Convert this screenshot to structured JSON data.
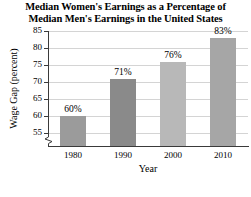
{
  "chart_data": {
    "type": "bar",
    "title": "Median Women's Earnings as a Percentage of Median Men's Earnings in the United States",
    "title_line_1": "Median Women's Earnings as a Percentage of",
    "title_line_2": "Median Men's Earnings in the United States",
    "categories": [
      "1980",
      "1990",
      "2000",
      "2010"
    ],
    "values": [
      60,
      71,
      76,
      83
    ],
    "data_labels": [
      "60%",
      "71%",
      "76%",
      "83%"
    ],
    "xlabel": "Year",
    "ylabel": "Wage Gap (percent)",
    "ylim": [
      53,
      85
    ],
    "ytick_values": [
      55,
      60,
      65,
      70,
      75,
      80,
      85
    ],
    "ytick_labels": [
      "55",
      "60",
      "65",
      "70",
      "75",
      "80",
      "85"
    ],
    "grid": true,
    "legend": "none",
    "axis_break": true,
    "bar_colors": [
      "#9b9b9b",
      "#8a8a8a",
      "#b8b8b8",
      "#a6a6a6"
    ],
    "grid_color": "#d4d4d4",
    "axis_color": "#3a3a3a"
  }
}
